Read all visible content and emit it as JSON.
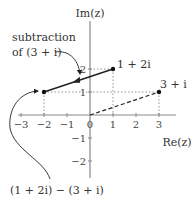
{
  "diagram": {
    "type": "complex-plane",
    "axes": {
      "x_label": "Re(z)",
      "y_label": "Im(z)",
      "x_ticks": [
        "−3",
        "−2",
        "−1",
        "0",
        "1",
        "2",
        "3"
      ],
      "y_ticks": [
        "2",
        "1",
        "−1",
        "−2"
      ]
    },
    "points": [
      {
        "label": "1 + 2i",
        "re": 1,
        "im": 2
      },
      {
        "label": "3 + i",
        "re": 3,
        "im": 1
      },
      {
        "label": "",
        "re": -2,
        "im": 1
      }
    ],
    "annotations": {
      "subtraction_line1": "subtraction",
      "subtraction_line2": "of (3 + i)",
      "result": "(1 + 2i) − (3 + i)"
    },
    "colors": {
      "axis": "#888888",
      "line": "#222222",
      "text": "#333333"
    }
  }
}
